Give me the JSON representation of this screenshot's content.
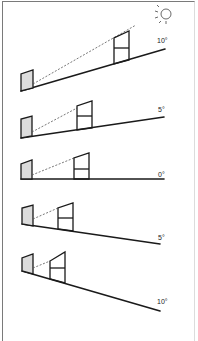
{
  "figure": {
    "icon": "sun-icon",
    "panels": [
      {
        "id": "slope-up-10",
        "label": "10°",
        "direction": "uphill"
      },
      {
        "id": "slope-up-5",
        "label": "5°",
        "direction": "uphill"
      },
      {
        "id": "slope-flat-0",
        "label": "0°",
        "direction": "flat"
      },
      {
        "id": "slope-down-5",
        "label": "5°",
        "direction": "downhill"
      },
      {
        "id": "slope-down-10",
        "label": "10°",
        "direction": "downhill"
      }
    ]
  },
  "colors": {
    "line": "#1a1a1a",
    "shading": "#dcdcdc",
    "frame": "#7a7a7a"
  }
}
